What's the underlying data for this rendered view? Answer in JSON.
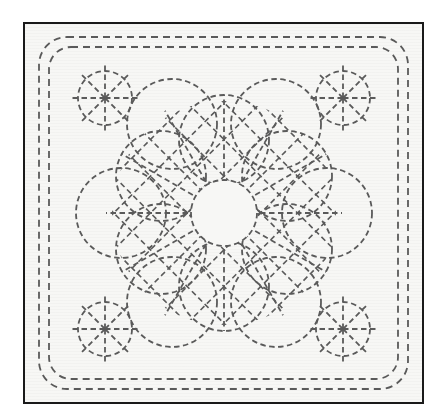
{
  "document": {
    "title": "Sashiko Stitching Pattern Diagram",
    "type": "line-art-diagram",
    "background_color": "#f7f7f5",
    "page_color": "#ffffff",
    "stitch_color": "#5a5a5a",
    "frame_color": "#1a1a1a"
  },
  "canvas": {
    "width": 445,
    "height": 420
  },
  "frame": {
    "name": "outer-rectangular-frame",
    "x": 23,
    "y": 22,
    "width": 401,
    "height": 382,
    "border_width": 2,
    "border_color": "#1a1a1a"
  },
  "border": {
    "name": "double-dashed-rounded-border",
    "line_count": 2,
    "dash_length": 7,
    "dash_gap": 5,
    "stroke_width": 1.8,
    "stroke_color": "#5a5a5a",
    "lines": [
      {
        "label": "outer-dashed-rect",
        "x": 14,
        "y": 13,
        "width": 369,
        "height": 352,
        "radius": 28
      },
      {
        "label": "inner-dashed-rect",
        "x": 24,
        "y": 23,
        "width": 349,
        "height": 332,
        "radius": 22
      }
    ]
  },
  "corner_motifs": {
    "name": "eight-spoke-wheel-motifs",
    "count": 4,
    "circle_radius": 27,
    "spoke_count": 8,
    "spoke_overshoot": 6,
    "dash_length": 5.5,
    "dash_gap": 3.5,
    "stroke_width": 1.8,
    "stroke_color": "#5a5a5a",
    "centers": [
      {
        "label": "top-left-wheel",
        "cx": 80,
        "cy": 74
      },
      {
        "label": "top-right-wheel",
        "cx": 318,
        "cy": 74
      },
      {
        "label": "bottom-left-wheel",
        "cx": 80,
        "cy": 305
      },
      {
        "label": "bottom-right-wheel",
        "cx": 318,
        "cy": 305
      }
    ]
  },
  "central_medallion": {
    "name": "flower-of-life-medallion",
    "center": {
      "cx": 199,
      "cy": 189
    },
    "dash_length": 5.5,
    "dash_gap": 3.5,
    "stroke_width": 1.8,
    "stroke_color": "#5a5a5a",
    "inner_circle": {
      "label": "center-circle",
      "cx": 199,
      "cy": 189,
      "r": 33
    },
    "petal_ring": {
      "label": "six-overlapping-circles",
      "count": 6,
      "radius": 45,
      "orbit_distance": 73,
      "start_angle_deg": -90,
      "centers": [
        {
          "label": "petal-circle-top",
          "cx": 199,
          "cy": 116
        },
        {
          "label": "petal-circle-upper-right",
          "cx": 262,
          "cy": 152
        },
        {
          "label": "petal-circle-lower-right",
          "cx": 262,
          "cy": 225
        },
        {
          "label": "petal-circle-bottom",
          "cx": 199,
          "cy": 262
        },
        {
          "label": "petal-circle-lower-left",
          "cx": 136,
          "cy": 225
        },
        {
          "label": "petal-circle-upper-left",
          "cx": 136,
          "cy": 152
        }
      ]
    },
    "outer_ring": {
      "label": "six-outer-circles",
      "count": 6,
      "radius": 45,
      "orbit_distance": 103,
      "start_angle_deg": -60,
      "centers": [
        {
          "label": "outer-circle-upper-right",
          "cx": 251,
          "cy": 100
        },
        {
          "label": "outer-circle-right",
          "cx": 302,
          "cy": 189
        },
        {
          "label": "outer-circle-lower-right",
          "cx": 251,
          "cy": 278
        },
        {
          "label": "outer-circle-lower-left",
          "cx": 147,
          "cy": 278
        },
        {
          "label": "outer-circle-left",
          "cx": 96,
          "cy": 189
        },
        {
          "label": "outer-circle-upper-left",
          "cx": 147,
          "cy": 100
        }
      ]
    },
    "lattice": {
      "label": "diagonal-crosshatch-lattice",
      "spacing": 26,
      "angle_deg": 45,
      "clip_radius": 112,
      "inner_clear_radius": 33,
      "stroke_width": 1.6
    },
    "radial_spokes": {
      "label": "radial-spoke-rays",
      "count": 12,
      "inner_radius": 36,
      "outer_radius": 118
    }
  }
}
